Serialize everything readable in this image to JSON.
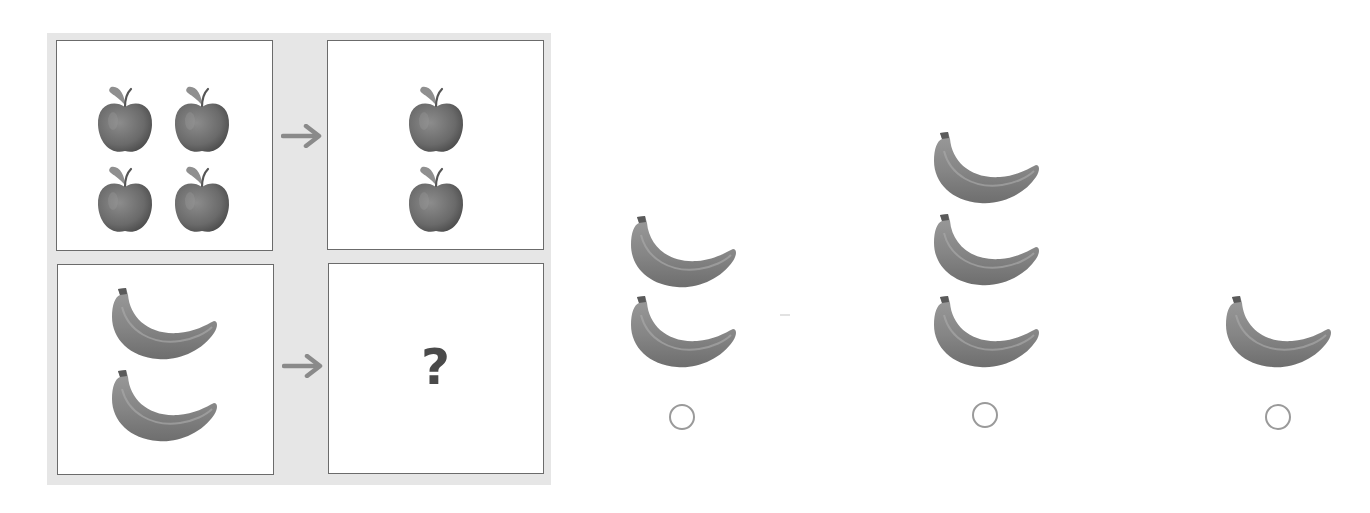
{
  "puzzle": {
    "title": "Analogy puzzle",
    "rows": [
      {
        "left": {
          "fruit": "apple",
          "count": 4
        },
        "right": {
          "fruit": "apple",
          "count": 2
        }
      },
      {
        "left": {
          "fruit": "banana",
          "count": 2
        },
        "right": {
          "placeholder": "?"
        }
      }
    ],
    "arrow_icon": "right-arrow-icon"
  },
  "options": [
    {
      "id": "option-1",
      "fruit": "banana",
      "count": 2,
      "selected": false
    },
    {
      "id": "option-2",
      "fruit": "banana",
      "count": 3,
      "selected": false
    },
    {
      "id": "option-3",
      "fruit": "banana",
      "count": 1,
      "selected": false
    }
  ],
  "colors": {
    "panel_bg": "#e6e6e6",
    "box_border": "#6b6b6b",
    "arrow": "#8a8a8a",
    "fruit": "#7a7a7a",
    "question_mark": "#4a4a4a",
    "radio_border": "#9a9a9a"
  }
}
